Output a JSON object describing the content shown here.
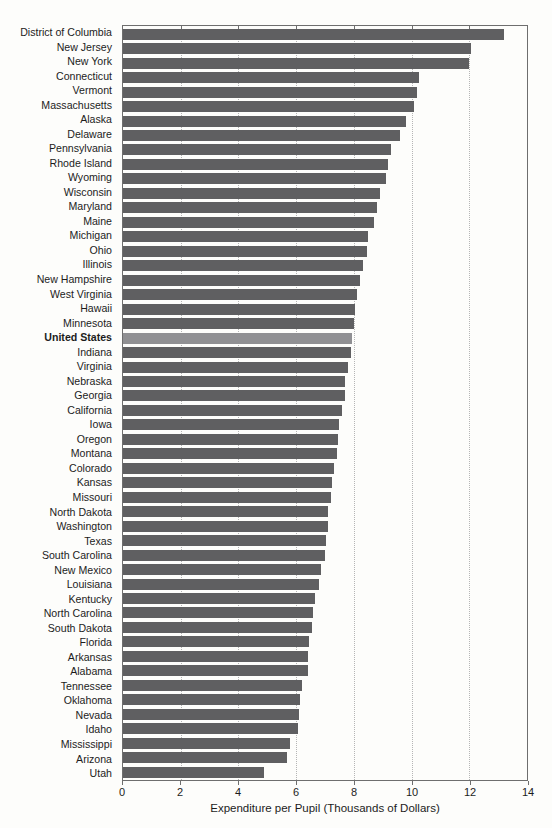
{
  "chart_data": {
    "type": "bar",
    "orientation": "horizontal",
    "title": "",
    "xlabel": "Expenditure per Pupil (Thousands of Dollars)",
    "ylabel": "",
    "xlim": [
      0,
      14
    ],
    "xticks": [
      0,
      2,
      4,
      6,
      8,
      10,
      12,
      14
    ],
    "gridlines": [
      2,
      4,
      6,
      8,
      10,
      12
    ],
    "grid_style": "dotted vertical",
    "legend": "none",
    "emphasis_category": "United States",
    "colors": {
      "bar": "#5f5f61",
      "emphasis_bar": "#909093",
      "grid": "#b5b5b5",
      "border": "#6e6e6e",
      "text": "#1c1c1c",
      "background": "#fdfdfb"
    },
    "categories": [
      "District of Columbia",
      "New Jersey",
      "New York",
      "Connecticut",
      "Vermont",
      "Massachusetts",
      "Alaska",
      "Delaware",
      "Pennsylvania",
      "Rhode Island",
      "Wyoming",
      "Wisconsin",
      "Maryland",
      "Maine",
      "Michigan",
      "Ohio",
      "Illinois",
      "New Hampshire",
      "West Virginia",
      "Hawaii",
      "Minnesota",
      "United States",
      "Indiana",
      "Virginia",
      "Nebraska",
      "Georgia",
      "California",
      "Iowa",
      "Oregon",
      "Montana",
      "Colorado",
      "Kansas",
      "Missouri",
      "North Dakota",
      "Washington",
      "Texas",
      "South Carolina",
      "New Mexico",
      "Louisiana",
      "Kentucky",
      "North Carolina",
      "South Dakota",
      "Florida",
      "Arkansas",
      "Alabama",
      "Tennessee",
      "Oklahoma",
      "Nevada",
      "Idaho",
      "Mississippi",
      "Arizona",
      "Utah"
    ],
    "values": [
      13.2,
      12.05,
      12.0,
      10.25,
      10.2,
      10.1,
      9.8,
      9.6,
      9.3,
      9.2,
      9.1,
      8.9,
      8.8,
      8.7,
      8.5,
      8.45,
      8.3,
      8.2,
      8.1,
      8.05,
      8.0,
      7.95,
      7.9,
      7.8,
      7.7,
      7.7,
      7.6,
      7.5,
      7.45,
      7.4,
      7.3,
      7.25,
      7.2,
      7.1,
      7.1,
      7.05,
      7.0,
      6.85,
      6.8,
      6.65,
      6.6,
      6.55,
      6.45,
      6.4,
      6.4,
      6.2,
      6.15,
      6.1,
      6.05,
      5.8,
      5.7,
      4.9
    ]
  }
}
